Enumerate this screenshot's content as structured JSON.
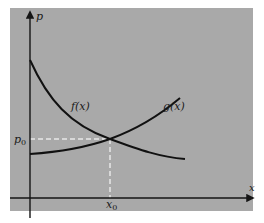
{
  "diagram": {
    "type": "supply-demand-intersection",
    "colors": {
      "page_background": "#ffffff",
      "panel_background": "#a9a9a9",
      "axis": "#151515",
      "curve": "#111111",
      "guide_lines": "#e8e8e8"
    },
    "axes": {
      "y_label": "p",
      "x_label": "x"
    },
    "curves": [
      {
        "name": "f",
        "label": "f(x)",
        "trend": "decreasing"
      },
      {
        "name": "g",
        "label": "g(x)",
        "trend": "increasing"
      }
    ],
    "equilibrium": {
      "price_label": "p",
      "price_subscript": "0",
      "quantity_label": "x",
      "quantity_subscript": "0"
    }
  }
}
